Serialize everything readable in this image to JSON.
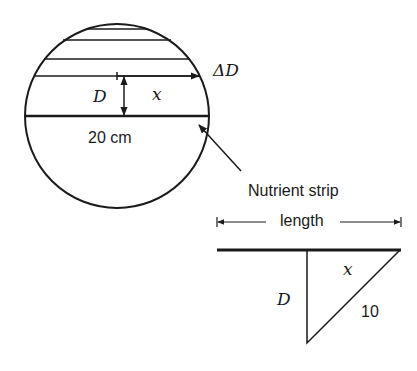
{
  "figure": {
    "circle": {
      "diameter_label": "20 cm",
      "depth_label": "D",
      "half_width_label": "x",
      "increment_label": "ΔD"
    },
    "callout": {
      "label": "Nutrient strip"
    },
    "triangle": {
      "length_label": "length",
      "leg_horizontal_label": "x",
      "leg_vertical_label": "D",
      "hypotenuse_label": "10"
    },
    "colors": {
      "stroke": "#1a1a1a",
      "background": "#ffffff"
    }
  }
}
